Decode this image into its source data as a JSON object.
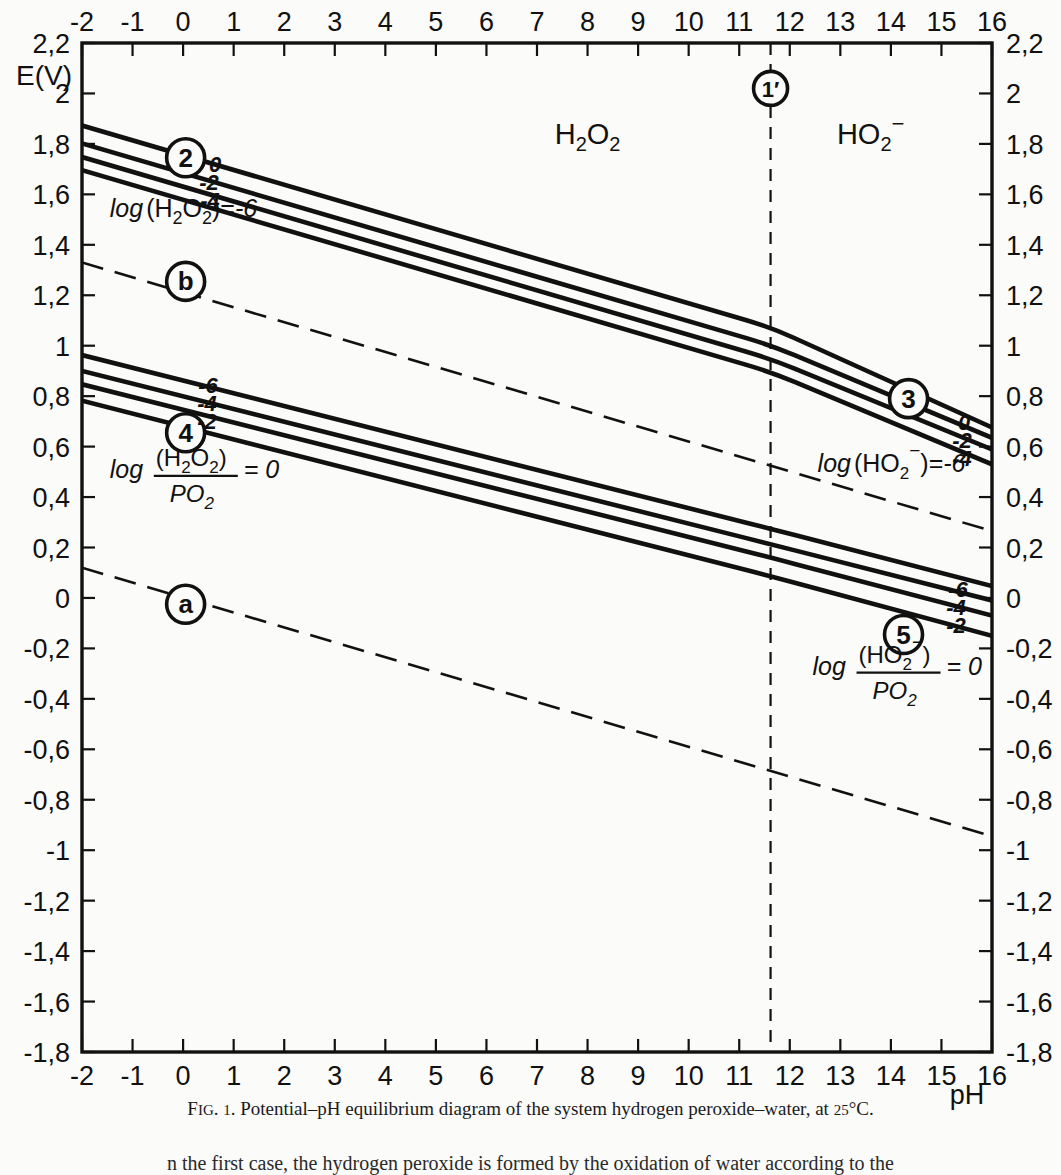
{
  "figure": {
    "caption_prefix": "F",
    "caption_smallcaps": "IG",
    "caption": "FIG. 1. Potential–pH equilibrium diagram of the system hydrogen peroxide–water, at 25°C.",
    "caption_head": "F",
    "caption_igdot": "IG. ",
    "caption_num": "1",
    "caption_rest": ". Potential–pH equilibrium diagram of the system hydrogen peroxide–water, at ",
    "caption_temp": "25",
    "caption_tail": "°C.",
    "body_text": "n the first case, the hydrogen peroxide is formed by the oxidation of water according to the"
  },
  "axes": {
    "y_label": "E(V)",
    "x_label": "pH",
    "x_ticks": [
      "-2",
      "-1",
      "0",
      "1",
      "2",
      "3",
      "4",
      "5",
      "6",
      "7",
      "8",
      "9",
      "10",
      "11",
      "12",
      "13",
      "14",
      "15",
      "16"
    ],
    "x_values": [
      -2,
      -1,
      0,
      1,
      2,
      3,
      4,
      5,
      6,
      7,
      8,
      9,
      10,
      11,
      12,
      13,
      14,
      15,
      16
    ],
    "y_ticks": [
      "2,2",
      "2",
      "1,8",
      "1,6",
      "1,4",
      "1,2",
      "1",
      "0,8",
      "0,6",
      "0,4",
      "0,2",
      "0",
      "-0,2",
      "-0,4",
      "-0,6",
      "-0,8",
      "-1",
      "-1,2",
      "-1,4",
      "-1,6",
      "-1,8"
    ],
    "y_values": [
      2.2,
      2.0,
      1.8,
      1.6,
      1.4,
      1.2,
      1.0,
      0.8,
      0.6,
      0.4,
      0.2,
      0,
      -0.2,
      -0.4,
      -0.6,
      -0.8,
      -1.0,
      -1.2,
      -1.4,
      -1.6,
      -1.8
    ],
    "xlim": [
      -2,
      16
    ],
    "ylim": [
      -1.8,
      2.2
    ],
    "grid": false
  },
  "domain_labels": [
    {
      "name": "domain-h2o2",
      "html": "H<tspan baseline-shift=\"sub\" font-size=\"16\">2</tspan>O<tspan baseline-shift=\"sub\" font-size=\"16\">2</tspan>",
      "text": "H2O2",
      "ph": 8.0,
      "E": 1.8
    },
    {
      "name": "domain-ho2",
      "text": "HO2-",
      "ph": 13.6,
      "E": 1.8
    }
  ],
  "markers": [
    {
      "id": "1prime",
      "label": "1′",
      "ph": 11.62,
      "E": 2.02
    },
    {
      "id": "2",
      "label": "2",
      "ph": 0.05,
      "E": 1.745
    },
    {
      "id": "b",
      "label": "b",
      "ph": 0.05,
      "E": 1.255
    },
    {
      "id": "4",
      "label": "4",
      "ph": 0.05,
      "E": 0.655
    },
    {
      "id": "a",
      "label": "a",
      "ph": 0.05,
      "E": -0.025
    },
    {
      "id": "3",
      "label": "3",
      "ph": 14.35,
      "E": 0.79
    },
    {
      "id": "5",
      "label": "5",
      "ph": 14.25,
      "E": -0.145
    }
  ],
  "annotations": [
    {
      "name": "label-log-h2o2",
      "text": "log (H2O2) = -6",
      "ph": -1.45,
      "E": 1.51
    },
    {
      "name": "label-log-h2o2-po2",
      "text": "log (H2O2)/PO2 = 0",
      "ph": -1.45,
      "E": 0.5
    },
    {
      "name": "label-log-ho2",
      "text": "log (HO2-) = -6",
      "ph": 12.55,
      "E": 0.5
    },
    {
      "name": "label-log-ho2-po2",
      "text": "log (HO2-)/PO2 = 0",
      "ph": 12.45,
      "E": -0.28
    }
  ],
  "line_end_labels": {
    "upper_left": [
      "0",
      "-2",
      "-4"
    ],
    "upper_right": [
      "0",
      "-2",
      "-4"
    ],
    "lower_left": [
      "-6",
      "-4",
      "-2"
    ],
    "lower_right": [
      "-6",
      "-4",
      "-2"
    ]
  },
  "chart_data": {
    "type": "line",
    "xlabel": "pH",
    "ylabel": "E(V)",
    "xlim": [
      -2,
      16
    ],
    "ylim": [
      -1.8,
      2.2
    ],
    "grid": false,
    "legend": "none",
    "breakpoint_pH": 11.62,
    "series": [
      {
        "name": "2: O2/H2O2 log(H2O2)=0",
        "style": "solid",
        "points": [
          [
            -2,
            1.873
          ],
          [
            11.62,
            1.073
          ],
          [
            16,
            0.676
          ]
        ]
      },
      {
        "name": "2: O2/H2O2 log(H2O2)=-2",
        "style": "solid",
        "points": [
          [
            -2,
            1.802
          ],
          [
            11.62,
            1.002
          ],
          [
            16,
            0.635
          ]
        ]
      },
      {
        "name": "2: O2/H2O2 log(H2O2)=-4",
        "style": "solid",
        "points": [
          [
            -2,
            1.748
          ],
          [
            11.62,
            0.948
          ],
          [
            16,
            0.589
          ]
        ]
      },
      {
        "name": "3: log(H2O2)=-6 / log(HO2-)=-6",
        "style": "solid",
        "points": [
          [
            -2,
            1.696
          ],
          [
            11.62,
            0.896
          ],
          [
            16,
            0.53
          ]
        ]
      },
      {
        "name": "b: O2/H2O equilibrium",
        "style": "dashed",
        "points": [
          [
            -2,
            1.33
          ],
          [
            16,
            0.265
          ]
        ]
      },
      {
        "name": "4: H2O2/PO2 log=-6",
        "style": "solid",
        "points": [
          [
            -2,
            0.963
          ],
          [
            11.62,
            0.274
          ],
          [
            16,
            0.047
          ]
        ]
      },
      {
        "name": "4: H2O2/PO2 log=-4",
        "style": "solid",
        "points": [
          [
            -2,
            0.9
          ],
          [
            11.62,
            0.213
          ],
          [
            16,
            -0.01
          ]
        ]
      },
      {
        "name": "4: H2O2/PO2 log=-2",
        "style": "solid",
        "points": [
          [
            -2,
            0.847
          ],
          [
            11.62,
            0.16
          ],
          [
            16,
            -0.07
          ]
        ]
      },
      {
        "name": "5: H2O2/PO2 log=0",
        "style": "solid",
        "points": [
          [
            -2,
            0.782
          ],
          [
            11.62,
            0.086
          ],
          [
            16,
            -0.15
          ]
        ]
      },
      {
        "name": "a: H2O/H2 equilibrium",
        "style": "dashed",
        "points": [
          [
            -2,
            0.12
          ],
          [
            16,
            -0.945
          ]
        ]
      },
      {
        "name": "1': H2O2/HO2- boundary",
        "style": "dashed-vertical",
        "points": [
          [
            11.62,
            2.2
          ],
          [
            11.62,
            -1.8
          ]
        ]
      }
    ]
  }
}
